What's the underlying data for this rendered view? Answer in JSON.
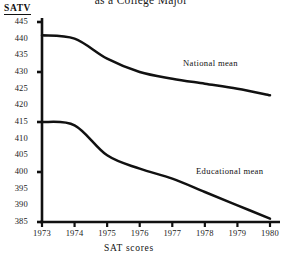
{
  "title": "as a College Major",
  "axis_title": "SATV",
  "xlabel": "SAT scores",
  "yticks": [
    "445",
    "440",
    "435",
    "430",
    "425",
    "420",
    "415",
    "410",
    "405",
    "400",
    "395",
    "390",
    "385"
  ],
  "xticks": [
    "1973",
    "1974",
    "1975",
    "1976",
    "1977",
    "1978",
    "1979",
    "1980"
  ],
  "series_labels": {
    "national": "National mean",
    "educational": "Educational mean"
  },
  "colors": {
    "line": "#111111",
    "axis": "#111111",
    "background": "#ffffff"
  },
  "chart_data": {
    "type": "line",
    "title": "as a College Major",
    "xlabel": "SAT scores",
    "ylabel": "SATV",
    "x": [
      1973,
      1974,
      1975,
      1976,
      1977,
      1978,
      1979,
      1980
    ],
    "xlim": [
      1973,
      1980
    ],
    "ylim": [
      385,
      445
    ],
    "ytick_values": [
      445,
      440,
      435,
      430,
      425,
      420,
      415,
      410,
      405,
      400,
      395,
      390,
      385
    ],
    "ytick_interval": 5,
    "major_tick_values": [
      445,
      430,
      415,
      400,
      385
    ],
    "grid": false,
    "legend": "inline-labels",
    "series": [
      {
        "name": "National mean",
        "values": [
          441,
          440,
          434,
          430,
          428,
          426.5,
          425,
          423
        ]
      },
      {
        "name": "Educational mean",
        "values": [
          415,
          414,
          405,
          401,
          398,
          394,
          390,
          386
        ]
      }
    ]
  }
}
